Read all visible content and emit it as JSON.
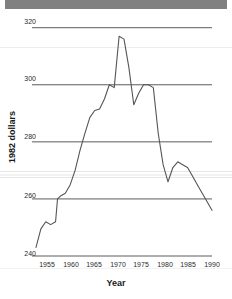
{
  "chart_data": {
    "type": "line",
    "title": "",
    "xlabel": "Year",
    "ylabel": "1982 dollars",
    "xlim": [
      1955,
      1991
    ],
    "ylim": [
      240,
      322
    ],
    "grid": true,
    "legend": "none",
    "y_ticks": [
      240,
      260,
      280,
      300,
      320
    ],
    "x_ticks": [
      1955,
      1960,
      1965,
      1970,
      1975,
      1980,
      1985,
      1990
    ],
    "series": [
      {
        "name": "1982 dollars",
        "color": "#555555",
        "x": [
          1955,
          1956,
          1957,
          1958,
          1959,
          1959.4,
          1960,
          1961,
          1962,
          1963,
          1964,
          1965,
          1966,
          1967,
          1968,
          1969,
          1970,
          1971,
          1972,
          1973,
          1974,
          1975,
          1976,
          1977,
          1978,
          1979,
          1980,
          1981,
          1982,
          1983,
          1984,
          1985,
          1986,
          1987,
          1988,
          1989,
          1990,
          1991
        ],
        "values": [
          243.0,
          249.5,
          252.0,
          251.0,
          252.0,
          260.0,
          261.0,
          262.0,
          265.0,
          270.0,
          277.0,
          283.0,
          288.5,
          291.0,
          291.5,
          295.0,
          300.0,
          299.0,
          317.0,
          316.0,
          306.0,
          293.0,
          297.0,
          300.0,
          300.0,
          299.0,
          283.0,
          272.0,
          266.0,
          271.0,
          273.0,
          272.0,
          271.0,
          268.0,
          265.0,
          262.0,
          259.0,
          256.0
        ]
      }
    ]
  },
  "axes": {
    "y_tick_labels": [
      "320",
      "300",
      "280",
      "260",
      "240"
    ],
    "x_tick_labels": [
      "1955",
      "1960",
      "1965",
      "1970",
      "1975",
      "1980",
      "1985",
      "1990"
    ],
    "x_title": "Year",
    "y_title": "1982 dollars"
  },
  "colors": {
    "line": "#555555",
    "gridline": "#4a4a4a",
    "text": "#2b2b2b",
    "scan_band": "#808080",
    "background": "#ffffff"
  }
}
